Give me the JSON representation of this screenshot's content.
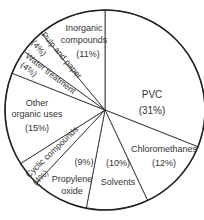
{
  "chart_data": {
    "type": "pie",
    "title": "",
    "start_angle_deg": 0,
    "direction": "clockwise",
    "slices": [
      {
        "label": "PVC",
        "value": 31,
        "pct_label": "(31%)"
      },
      {
        "label": "Chloromethanes",
        "value": 12,
        "pct_label": "(12%)"
      },
      {
        "label": "Solvents",
        "value": 10,
        "pct_label": "(10%)"
      },
      {
        "label": "Propylene oxide",
        "value": 9,
        "pct_label": "(9%)"
      },
      {
        "label": "Cyclic compounds",
        "value": 4,
        "pct_label": "(4%)"
      },
      {
        "label": "Other organic uses",
        "value": 15,
        "pct_label": "(15%)"
      },
      {
        "label": "Water treatment",
        "value": 4,
        "pct_label": "(4%)"
      },
      {
        "label": "Pulp and paper",
        "value": 4,
        "pct_label": "(4%)"
      },
      {
        "label": "Inorganic compounds",
        "value": 11,
        "pct_label": "(11%)"
      }
    ],
    "colors": {
      "fill": "#ffffff",
      "stroke": "#222222",
      "text": "#333333"
    }
  },
  "labels": {
    "pvc": {
      "line1": "PVC",
      "pct": "(31%)"
    },
    "chloromethanes": {
      "line1": "Chloromethanes",
      "pct": "(12%)"
    },
    "solvents": {
      "line1": "Solvents",
      "pct": "(10%)"
    },
    "propylene_oxide": {
      "line1": "Propylene",
      "line2": "oxide",
      "pct": "(9%)"
    },
    "cyclic": {
      "line1": "Cyclic compounds",
      "pct": "(4%)"
    },
    "other_organic": {
      "line1": "Other",
      "line2": "organic uses",
      "pct": "(15%)"
    },
    "water": {
      "line1": "Water treatment",
      "pct": "(4%)"
    },
    "pulp": {
      "line1": "Pulp and paper",
      "pct": "(4%)"
    },
    "inorganic": {
      "line1": "Inorganic",
      "line2": "compounds",
      "pct": "(11%)"
    }
  }
}
